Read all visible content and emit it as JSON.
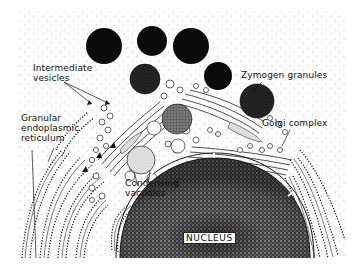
{
  "figure": {
    "labels": {
      "intermediate_vesicles": [
        "Intermediate",
        "vesicles"
      ],
      "zymogen_granules": "Zymogen granules",
      "golgi_complex": "Golgi complex",
      "granular_er": [
        "Granular",
        "endoplasmic",
        "reticulum"
      ],
      "condensing_vacuoles": [
        "Condensing",
        "vacuoles"
      ],
      "nucleus": "NUCLEUS"
    },
    "colors": {
      "ink": "#111111",
      "background": "#ffffff",
      "granule_dark": "#0a0a0a",
      "granule_stippled": "#3a3a3a",
      "vacuole_grey": "#8a8a8a"
    }
  }
}
